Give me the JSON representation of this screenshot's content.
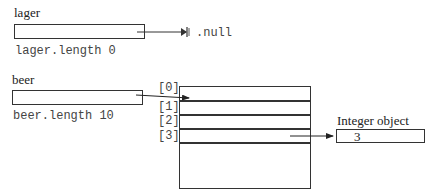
{
  "lager": {
    "name": "lager",
    "length_label": "lager.length 0",
    "null_label": ".null"
  },
  "beer": {
    "name": "beer",
    "length_label": "beer.length 10",
    "array": {
      "indices": [
        "[0]",
        "[1]",
        "[2]",
        "[3]"
      ]
    }
  },
  "integer_object": {
    "label": "Integer object",
    "value": "3"
  }
}
